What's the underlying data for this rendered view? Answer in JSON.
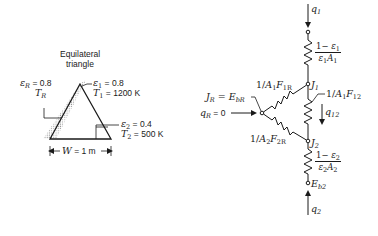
{
  "geometry_panel": {
    "shape_label_line1": "Equilateral",
    "shape_label_line2": "triangle",
    "surface_R": {
      "emissivity_sym": "ε",
      "emissivity_sub": "R",
      "emissivity_val": " = 0.8",
      "temp_sym": "T",
      "temp_sub": "R"
    },
    "surface_1": {
      "emissivity_sym": "ε",
      "emissivity_sub": "1",
      "emissivity_val": " = 0.8",
      "temp_sym": "T",
      "temp_sub": "1",
      "temp_val": " = 1200 K"
    },
    "surface_2": {
      "emissivity_sym": "ε",
      "emissivity_sub": "2",
      "emissivity_val": " = 0.4",
      "temp_sym": "T",
      "temp_sub": "2",
      "temp_val": " = 500 K"
    },
    "width": {
      "sym": "W",
      "val": " = 1 m"
    }
  },
  "network_panel": {
    "q1": {
      "sym": "q",
      "sub": "1"
    },
    "q2": {
      "sym": "q",
      "sub": "2"
    },
    "q12": {
      "sym": "q",
      "sub": "12"
    },
    "qR": {
      "sym": "q",
      "sub": "R",
      "val": " = 0"
    },
    "JR": {
      "lhs": "J",
      "lhs_sub": "R",
      "eq": " = ",
      "rhs": "E",
      "rhs_sub": "bR"
    },
    "J1": {
      "sym": "J",
      "sub": "1"
    },
    "J2": {
      "sym": "J",
      "sub": "2"
    },
    "Eb2": {
      "sym": "E",
      "sub": "b2"
    },
    "R_surface1": {
      "num_a": "1− ",
      "num_sym": "ε",
      "num_sub": "1",
      "den_sym": "ε",
      "den_sub": "1",
      "den_sym2": "A",
      "den_sub2": "1"
    },
    "R_surface2": {
      "num_a": "1− ",
      "num_sym": "ε",
      "num_sub": "2",
      "den_sym": "ε",
      "den_sub": "2",
      "den_sym2": "A",
      "den_sub2": "2"
    },
    "R_1R": {
      "pre": "1/",
      "a": "A",
      "a_sub": "1",
      "f": "F",
      "f_sub": "1R"
    },
    "R_2R": {
      "pre": "1/",
      "a": "A",
      "a_sub": "2",
      "f": "F",
      "f_sub": "2R"
    },
    "R_12": {
      "pre": "1/",
      "a": "A",
      "a_sub": "1",
      "f": "F",
      "f_sub": "12"
    }
  },
  "colors": {
    "ink": "#1a1a1a",
    "hatch": "#9a9a9a",
    "background": "#ffffff"
  }
}
